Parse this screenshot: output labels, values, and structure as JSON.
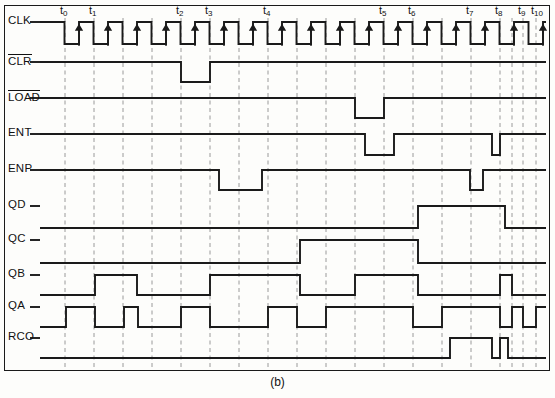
{
  "figure": {
    "caption": "(b)",
    "kind": "digital-timing-diagram",
    "background": "#fdfdfb",
    "trace_color": "#1a1a1a",
    "grid_color": "#9a9a9a"
  },
  "time_markers": [
    {
      "name": "t",
      "index": "0",
      "x": 65
    },
    {
      "name": "t",
      "index": "1",
      "x": 94
    },
    {
      "name": "t",
      "index": "2",
      "x": 181
    },
    {
      "name": "t",
      "index": "3",
      "x": 210
    },
    {
      "name": "t",
      "index": "4",
      "x": 268
    },
    {
      "name": "t",
      "index": "5",
      "x": 384
    },
    {
      "name": "t",
      "index": "6",
      "x": 413
    },
    {
      "name": "t",
      "index": "7",
      "x": 471
    },
    {
      "name": "t",
      "index": "8",
      "x": 500
    },
    {
      "name": "t",
      "index": "9",
      "x": 523
    },
    {
      "name": "t",
      "index": "10",
      "x": 536
    }
  ],
  "gridlines": [
    65,
    94,
    123,
    152,
    181,
    210,
    239,
    268,
    297,
    326,
    355,
    384,
    413,
    442,
    471,
    500,
    512,
    523,
    536
  ],
  "signals": [
    {
      "name": "CLK",
      "label": "CLK",
      "overbar": false,
      "row_y": 32,
      "high": 22,
      "low": 44,
      "type": "clock",
      "clock": {
        "start": 50,
        "end": 546,
        "period": 29,
        "high_width": 14.5,
        "first_high_start": 50,
        "arrows": true
      }
    },
    {
      "name": "CLR",
      "label": "CLR",
      "overbar": true,
      "row_y": 62,
      "high": 62,
      "low": 82,
      "type": "level",
      "initial": "high",
      "edges": [
        {
          "x": 181,
          "to": "low"
        },
        {
          "x": 210,
          "to": "high"
        }
      ]
    },
    {
      "name": "LOAD",
      "label": "LOAD",
      "overbar": true,
      "row_y": 98,
      "high": 98,
      "low": 118,
      "type": "level",
      "initial": "high",
      "edges": [
        {
          "x": 355,
          "to": "low"
        },
        {
          "x": 384,
          "to": "high"
        }
      ]
    },
    {
      "name": "ENT",
      "label": "ENT",
      "overbar": false,
      "row_y": 134,
      "high": 134,
      "low": 155,
      "type": "level",
      "initial": "high",
      "edges": [
        {
          "x": 365,
          "to": "low"
        },
        {
          "x": 394,
          "to": "high"
        },
        {
          "x": 492,
          "to": "low"
        },
        {
          "x": 500,
          "to": "high"
        }
      ]
    },
    {
      "name": "ENP",
      "label": "ENP",
      "overbar": false,
      "row_y": 170,
      "high": 170,
      "low": 190,
      "type": "level",
      "initial": "high",
      "edges": [
        {
          "x": 219,
          "to": "low"
        },
        {
          "x": 262,
          "to": "high"
        },
        {
          "x": 470,
          "to": "low"
        },
        {
          "x": 483,
          "to": "high"
        }
      ]
    },
    {
      "name": "QD",
      "label": "QD",
      "overbar": false,
      "row_y": 228,
      "high": 206,
      "low": 228,
      "type": "level",
      "initial": "low",
      "edges": [
        {
          "x": 418,
          "to": "high"
        },
        {
          "x": 505,
          "to": "low"
        }
      ]
    },
    {
      "name": "QC",
      "label": "QC",
      "overbar": false,
      "row_y": 263,
      "high": 240,
      "low": 263,
      "type": "level",
      "initial": "low",
      "edges": [
        {
          "x": 300,
          "to": "high"
        },
        {
          "x": 418,
          "to": "low"
        }
      ]
    },
    {
      "name": "QB",
      "label": "QB",
      "overbar": false,
      "row_y": 295,
      "high": 275,
      "low": 295,
      "type": "level",
      "initial": "low",
      "edges": [
        {
          "x": 95,
          "to": "high"
        },
        {
          "x": 137,
          "to": "low"
        },
        {
          "x": 210,
          "to": "high"
        },
        {
          "x": 300,
          "to": "low"
        },
        {
          "x": 355,
          "to": "high"
        },
        {
          "x": 418,
          "to": "low"
        },
        {
          "x": 500,
          "to": "high"
        },
        {
          "x": 512,
          "to": "low"
        }
      ]
    },
    {
      "name": "QA",
      "label": "QA",
      "overbar": false,
      "row_y": 327,
      "high": 307,
      "low": 327,
      "type": "level",
      "initial": "low",
      "edges": [
        {
          "x": 66,
          "to": "high"
        },
        {
          "x": 95,
          "to": "low"
        },
        {
          "x": 124,
          "to": "high"
        },
        {
          "x": 138,
          "to": "low"
        },
        {
          "x": 181,
          "to": "high"
        },
        {
          "x": 210,
          "to": "low"
        },
        {
          "x": 268,
          "to": "high"
        },
        {
          "x": 297,
          "to": "low"
        },
        {
          "x": 326,
          "to": "high"
        },
        {
          "x": 413,
          "to": "low"
        },
        {
          "x": 442,
          "to": "high"
        },
        {
          "x": 500,
          "to": "low"
        },
        {
          "x": 512,
          "to": "high"
        },
        {
          "x": 523,
          "to": "low"
        },
        {
          "x": 536,
          "to": "high"
        }
      ]
    },
    {
      "name": "RCO",
      "label": "RCO",
      "overbar": false,
      "row_y": 358,
      "high": 338,
      "low": 358,
      "type": "level",
      "initial": "low",
      "edges": [
        {
          "x": 450,
          "to": "high"
        },
        {
          "x": 492,
          "to": "low"
        },
        {
          "x": 500,
          "to": "high"
        },
        {
          "x": 508,
          "to": "low"
        }
      ]
    }
  ],
  "label_column": {
    "x": 8,
    "stub_start": 40,
    "stub_end": 50
  }
}
